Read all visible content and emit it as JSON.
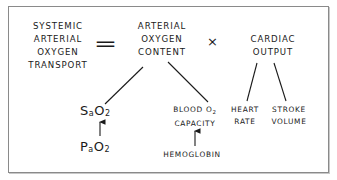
{
  "diagram": {
    "type": "equation-tree",
    "equation": {
      "lhs": [
        "SYSTEMIC",
        "ARTERIAL",
        "OXYGEN",
        "TRANSPORT"
      ],
      "equals_symbol": "=",
      "term1": [
        "ARTERIAL",
        "OXYGEN",
        "CONTENT"
      ],
      "times_symbol": "×",
      "term2": [
        "CARDIAC",
        "OUTPUT"
      ]
    },
    "content_children": {
      "sao2": {
        "main": "S",
        "sub_a": "a",
        "o": "O",
        "sub_2": "2"
      },
      "blood_o2_capacity": {
        "line1": "BLOOD O",
        "line1_sub": "2",
        "line2": "CAPACITY"
      }
    },
    "sao2_source": {
      "main": "P",
      "sub_a": "a",
      "o": "O",
      "sub_2": "2"
    },
    "capacity_source": "HEMOGLOBIN",
    "output_children": {
      "heart_rate": [
        "HEART",
        "RATE"
      ],
      "stroke_volume": [
        "STROKE",
        "VOLUME"
      ]
    },
    "edges": [
      {
        "from": "ARTERIAL OXYGEN CONTENT",
        "to": "SaO2",
        "style": "line"
      },
      {
        "from": "ARTERIAL OXYGEN CONTENT",
        "to": "BLOOD O2 CAPACITY",
        "style": "line"
      },
      {
        "from": "CARDIAC OUTPUT",
        "to": "HEART RATE",
        "style": "line"
      },
      {
        "from": "CARDIAC OUTPUT",
        "to": "STROKE VOLUME",
        "style": "line"
      },
      {
        "from": "PaO2",
        "to": "SaO2",
        "style": "arrow"
      },
      {
        "from": "HEMOGLOBIN",
        "to": "BLOOD O2 CAPACITY",
        "style": "arrow"
      }
    ],
    "colors": {
      "ink": "#1a1a1a",
      "border": "#8a8a8a",
      "background": "#ffffff"
    }
  }
}
